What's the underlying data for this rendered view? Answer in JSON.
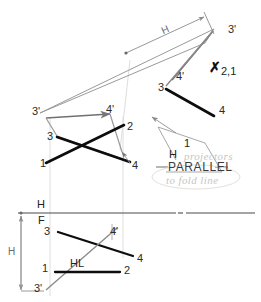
{
  "drawing": {
    "title": "Descriptive geometry construction: true length and point view of a line",
    "colors": {
      "paper": "#ffffff",
      "ink_bold": "#111111",
      "ink_light": "#8a8a8a",
      "ink_mid": "#555555",
      "construction": "#c8c8c8",
      "pencil_faint": "#c9c6c4"
    }
  },
  "views": {
    "auxiliary_top": {
      "name": "second auxiliary / point view region",
      "point_labels": [
        {
          "id": "p3prime-top-right",
          "text": "3'",
          "x": 228,
          "y": 30
        },
        {
          "id": "p4prime-top-right",
          "text": "4'",
          "x": 176,
          "y": 77
        },
        {
          "id": "p3-top-right",
          "text": "3",
          "x": 160,
          "y": 88
        },
        {
          "id": "p4-top-right",
          "text": "4",
          "x": 222,
          "y": 110
        },
        {
          "id": "p3prime-left",
          "text": "3'",
          "x": 35,
          "y": 112
        },
        {
          "id": "p4prime-left",
          "text": "4'",
          "x": 108,
          "y": 110
        },
        {
          "id": "p3-left",
          "text": "3",
          "x": 49,
          "y": 138
        },
        {
          "id": "p2-mid",
          "text": "2",
          "x": 128,
          "y": 128
        },
        {
          "id": "p4-mid",
          "text": "4",
          "x": 133,
          "y": 166
        },
        {
          "id": "p1-mid",
          "text": "1",
          "x": 41,
          "y": 165
        }
      ],
      "dimension_h_label": "H",
      "point_view_marker": {
        "glyph": "✗",
        "label": "2,1"
      }
    },
    "front_bottom": {
      "name": "H/F principal view",
      "fold_line_labels": {
        "upper": "H",
        "lower": "F"
      },
      "dimension_h_label": "H",
      "horizontal_line_label": "HL",
      "point_labels": [
        {
          "id": "p3-bottom",
          "text": "3",
          "x": 46,
          "y": 231
        },
        {
          "id": "p4prime-bottom",
          "text": "4'",
          "x": 110,
          "y": 233
        },
        {
          "id": "p4-bottom",
          "text": "4",
          "x": 137,
          "y": 258
        },
        {
          "id": "p1-bottom",
          "text": "1",
          "x": 42,
          "y": 267
        },
        {
          "id": "p2-bottom",
          "text": "2",
          "x": 124,
          "y": 277
        },
        {
          "id": "p3prime-bottom",
          "text": "3'",
          "x": 36,
          "y": 288
        }
      ]
    }
  },
  "callout": {
    "note_primary": "PARALLEL",
    "note_fold_upper": "H",
    "note_fold_lower": "1",
    "handwritten_top": "projectors",
    "handwritten_bottom": "to fold line"
  }
}
